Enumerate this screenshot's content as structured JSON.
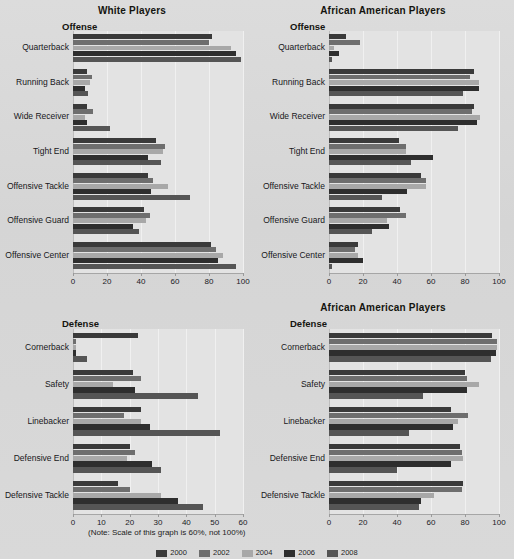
{
  "note": "(Note: Scale of this graph is 60%, not 100%)",
  "legend": {
    "items": [
      {
        "label": "2000",
        "color": "#3a3a3a"
      },
      {
        "label": "2002",
        "color": "#6e6e6e"
      },
      {
        "label": "2004",
        "color": "#a8a8a8"
      },
      {
        "label": "2006",
        "color": "#2e2e2e"
      },
      {
        "label": "2008",
        "color": "#555555"
      }
    ]
  },
  "series_colors": [
    "#3a3a3a",
    "#6e6e6e",
    "#a8a8a8",
    "#2e2e2e",
    "#555555"
  ],
  "panels": [
    {
      "id": "offense-white",
      "title": "White Players",
      "side_title": "Offense"
    },
    {
      "id": "offense-african-american",
      "title": "African American Players",
      "side_title": "Offense"
    },
    {
      "id": "defense-white",
      "title": "",
      "side_title": "Defense"
    },
    {
      "id": "defense-african-american",
      "title": "African American Players",
      "side_title": "Defense"
    }
  ],
  "chart_data": [
    {
      "type": "bar",
      "orientation": "horizontal",
      "title": "White Players",
      "subtitle": "Offense",
      "xlabel": "",
      "ylabel": "",
      "xlim": [
        0,
        100
      ],
      "xticks": [
        0,
        20,
        40,
        60,
        80,
        100
      ],
      "grid": true,
      "legend_position": "bottom",
      "categories": [
        "Quarterback",
        "Running Back",
        "Wide Receiver",
        "Tight End",
        "Offensive Tackle",
        "Offensive Guard",
        "Offensive Center"
      ],
      "series": [
        {
          "name": "2000",
          "values": [
            82,
            8,
            8,
            49,
            44,
            42,
            81
          ]
        },
        {
          "name": "2002",
          "values": [
            80,
            11,
            12,
            54,
            47,
            45,
            84
          ]
        },
        {
          "name": "2004",
          "values": [
            93,
            10,
            7,
            53,
            56,
            43,
            88
          ]
        },
        {
          "name": "2006",
          "values": [
            96,
            7,
            8,
            44,
            46,
            35,
            85
          ]
        },
        {
          "name": "2008",
          "values": [
            99,
            9,
            22,
            52,
            69,
            39,
            96
          ]
        }
      ]
    },
    {
      "type": "bar",
      "orientation": "horizontal",
      "title": "African American Players",
      "subtitle": "Offense",
      "xlabel": "",
      "ylabel": "",
      "xlim": [
        0,
        100
      ],
      "xticks": [
        0,
        20,
        40,
        60,
        80,
        100
      ],
      "grid": true,
      "legend_position": "bottom",
      "categories": [
        "Quarterback",
        "Running Back",
        "Wide Receiver",
        "Tight End",
        "Offensive Tackle",
        "Offensive Guard",
        "Offensive Center"
      ],
      "series": [
        {
          "name": "2000",
          "values": [
            10,
            85,
            85,
            41,
            54,
            42,
            17
          ]
        },
        {
          "name": "2002",
          "values": [
            18,
            83,
            84,
            45,
            57,
            45,
            15
          ]
        },
        {
          "name": "2004",
          "values": [
            3,
            88,
            89,
            45,
            57,
            34,
            17
          ]
        },
        {
          "name": "2006",
          "values": [
            6,
            88,
            87,
            61,
            46,
            35,
            20
          ]
        },
        {
          "name": "2008",
          "values": [
            2,
            79,
            76,
            48,
            31,
            25,
            2
          ]
        }
      ]
    },
    {
      "type": "bar",
      "orientation": "horizontal",
      "title": "",
      "subtitle": "Defense",
      "xlabel": "",
      "ylabel": "",
      "xlim": [
        0,
        60
      ],
      "xticks": [
        0,
        10,
        20,
        30,
        40,
        50,
        60
      ],
      "grid": true,
      "legend_position": "bottom",
      "categories": [
        "Cornerback",
        "Safety",
        "Linebacker",
        "Defensive End",
        "Defensive Tackle"
      ],
      "series": [
        {
          "name": "2000",
          "values": [
            23,
            21,
            24,
            20,
            16
          ]
        },
        {
          "name": "2002",
          "values": [
            1,
            24,
            18,
            22,
            20
          ]
        },
        {
          "name": "2004",
          "values": [
            1,
            14,
            24,
            19,
            31
          ]
        },
        {
          "name": "2006",
          "values": [
            1,
            22,
            27,
            28,
            37
          ]
        },
        {
          "name": "2008",
          "values": [
            5,
            44,
            52,
            31,
            46
          ]
        }
      ]
    },
    {
      "type": "bar",
      "orientation": "horizontal",
      "title": "African American Players",
      "subtitle": "Defense",
      "xlabel": "",
      "ylabel": "",
      "xlim": [
        0,
        100
      ],
      "xticks": [
        0,
        20,
        40,
        60,
        80,
        100
      ],
      "grid": true,
      "legend_position": "bottom",
      "categories": [
        "Cornerback",
        "Safety",
        "Linebacker",
        "Defensive End",
        "Defensive Tackle"
      ],
      "series": [
        {
          "name": "2000",
          "values": [
            96,
            80,
            72,
            77,
            79
          ]
        },
        {
          "name": "2002",
          "values": [
            99,
            81,
            82,
            78,
            78
          ]
        },
        {
          "name": "2004",
          "values": [
            99,
            88,
            76,
            79,
            62
          ]
        },
        {
          "name": "2006",
          "values": [
            98,
            81,
            73,
            72,
            54
          ]
        },
        {
          "name": "2008",
          "values": [
            95,
            55,
            47,
            40,
            53
          ]
        }
      ]
    }
  ]
}
